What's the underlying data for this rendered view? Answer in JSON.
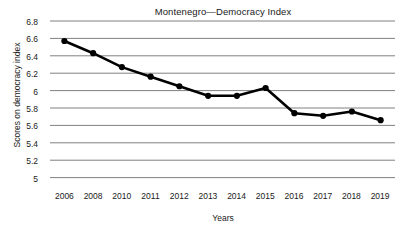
{
  "chart_data": {
    "type": "line",
    "title": "Montenegro—Democracy Index",
    "xlabel": "Years",
    "ylabel": "Scores on democracy index",
    "categories": [
      "2006",
      "2008",
      "2010",
      "2011",
      "2012",
      "2013",
      "2014",
      "2015",
      "2016",
      "2017",
      "2018",
      "2019"
    ],
    "series": [
      {
        "name": "Scores on democracy index",
        "values": [
          6.57,
          6.43,
          6.27,
          6.16,
          6.05,
          5.94,
          5.94,
          6.03,
          5.74,
          5.71,
          5.76,
          5.66
        ]
      }
    ],
    "ylim": [
      5,
      6.8
    ],
    "ytick_labels": [
      "6.8",
      "6.6",
      "6.4",
      "6.2",
      "6",
      "5.8",
      "5.6",
      "5.4",
      "5.2",
      "5"
    ],
    "ytick_values": [
      6.8,
      6.6,
      6.4,
      6.2,
      6.0,
      5.8,
      5.6,
      5.4,
      5.2,
      5.0
    ],
    "grid": true,
    "legend": "none",
    "line_color": "#000000",
    "marker_color": "#000000",
    "grid_color": "#808080"
  }
}
